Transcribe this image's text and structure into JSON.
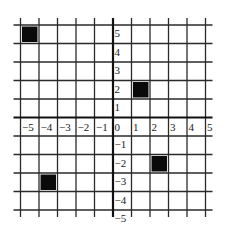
{
  "diagram": {
    "type": "coordinate-grid",
    "x_range": [
      -5,
      5
    ],
    "y_range": [
      -5,
      5
    ],
    "x_tick_labels": [
      "−5",
      "−4",
      "−3",
      "−2",
      "−1",
      "0",
      "1",
      "2",
      "3",
      "4",
      "5"
    ],
    "y_tick_labels": [
      "5",
      "4",
      "3",
      "2",
      "1",
      "−1",
      "−2",
      "−3",
      "−4",
      "−5"
    ],
    "filled_squares": [
      {
        "x0": -5,
        "x1": -4,
        "y0": 4,
        "y1": 5
      },
      {
        "x0": 1,
        "x1": 2,
        "y0": 1,
        "y1": 2
      },
      {
        "x0": 2,
        "x1": 3,
        "y0": -3,
        "y1": -2
      },
      {
        "x0": -4,
        "x1": -3,
        "y0": -4,
        "y1": -3
      }
    ],
    "colors": {
      "grid_line": "#2a2a2a",
      "axis_line": "#111111",
      "fill": "#0a0a0a",
      "background": "#ffffff"
    }
  }
}
